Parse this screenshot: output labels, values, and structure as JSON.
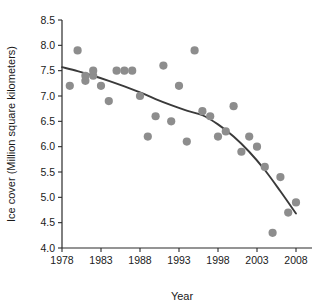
{
  "chart_data": {
    "type": "scatter",
    "title": "",
    "subtitle": "",
    "xlabel": "Year",
    "ylabel": "Ice cover (Million square kilometers)",
    "xlim": [
      1978,
      2008
    ],
    "ylim": [
      4.0,
      8.5
    ],
    "xticks": [
      1978,
      1983,
      1988,
      1993,
      1998,
      2003,
      2008
    ],
    "xtick_labels": [
      "1978",
      "1983",
      "1988",
      "1993",
      "1998",
      "2003",
      "2008"
    ],
    "yticks": [
      4.0,
      4.5,
      5.0,
      5.5,
      6.0,
      6.5,
      7.0,
      7.5,
      8.0,
      8.5
    ],
    "ytick_labels": [
      "4.0",
      "4.5",
      "5.0",
      "5.5",
      "6.0",
      "6.5",
      "7.0",
      "7.5",
      "8.0",
      "8.5"
    ],
    "grid": false,
    "legend": false,
    "legend_position": "none",
    "marker_color": "#8d8d8d",
    "trend_color": "#3a3a3a",
    "axis_color": "#2b2b2b",
    "background": "#ffffff",
    "x": [
      1979,
      1980,
      1981,
      1981,
      1982,
      1982,
      1983,
      1984,
      1985,
      1986,
      1987,
      1988,
      1989,
      1990,
      1991,
      1992,
      1993,
      1994,
      1995,
      1996,
      1997,
      1998,
      1999,
      2000,
      2001,
      2002,
      2003,
      2004,
      2005,
      2006,
      2007,
      2008
    ],
    "y": [
      7.2,
      7.9,
      7.3,
      7.4,
      7.4,
      7.5,
      7.2,
      6.9,
      7.5,
      7.5,
      7.5,
      7.0,
      6.2,
      6.6,
      7.6,
      6.5,
      7.2,
      6.1,
      7.9,
      6.7,
      6.6,
      6.2,
      6.3,
      6.8,
      5.9,
      6.2,
      6.0,
      5.6,
      4.3,
      5.4,
      4.7,
      4.9
    ],
    "series": [
      {
        "name": "Annual minimum ice cover",
        "type": "scatter",
        "points": [
          {
            "year": 1979,
            "value": 7.2
          },
          {
            "year": 1980,
            "value": 7.9
          },
          {
            "year": 1981,
            "value": 7.3
          },
          {
            "year": 1981,
            "value": 7.4
          },
          {
            "year": 1982,
            "value": 7.4
          },
          {
            "year": 1982,
            "value": 7.5
          },
          {
            "year": 1983,
            "value": 7.2
          },
          {
            "year": 1984,
            "value": 6.9
          },
          {
            "year": 1985,
            "value": 7.5
          },
          {
            "year": 1986,
            "value": 7.5
          },
          {
            "year": 1987,
            "value": 7.5
          },
          {
            "year": 1988,
            "value": 7.0
          },
          {
            "year": 1989,
            "value": 6.2
          },
          {
            "year": 1990,
            "value": 6.6
          },
          {
            "year": 1991,
            "value": 7.6
          },
          {
            "year": 1992,
            "value": 6.5
          },
          {
            "year": 1993,
            "value": 7.2
          },
          {
            "year": 1994,
            "value": 6.1
          },
          {
            "year": 1995,
            "value": 7.9
          },
          {
            "year": 1996,
            "value": 6.7
          },
          {
            "year": 1997,
            "value": 6.6
          },
          {
            "year": 1998,
            "value": 6.2
          },
          {
            "year": 1999,
            "value": 6.3
          },
          {
            "year": 2000,
            "value": 6.8
          },
          {
            "year": 2001,
            "value": 5.9
          },
          {
            "year": 2002,
            "value": 6.2
          },
          {
            "year": 2003,
            "value": 6.0
          },
          {
            "year": 2004,
            "value": 5.6
          },
          {
            "year": 2005,
            "value": 4.3
          },
          {
            "year": 2006,
            "value": 5.4
          },
          {
            "year": 2007,
            "value": 4.7
          },
          {
            "year": 2008,
            "value": 4.9
          }
        ]
      },
      {
        "name": "Fitted trend",
        "type": "line",
        "points": [
          {
            "year": 1978,
            "value": 7.57
          },
          {
            "year": 1980,
            "value": 7.49
          },
          {
            "year": 1982,
            "value": 7.4
          },
          {
            "year": 1984,
            "value": 7.3
          },
          {
            "year": 1986,
            "value": 7.19
          },
          {
            "year": 1988,
            "value": 7.07
          },
          {
            "year": 1990,
            "value": 6.94
          },
          {
            "year": 1992,
            "value": 6.82
          },
          {
            "year": 1994,
            "value": 6.71
          },
          {
            "year": 1996,
            "value": 6.62
          },
          {
            "year": 1998,
            "value": 6.44
          },
          {
            "year": 2000,
            "value": 6.2
          },
          {
            "year": 2002,
            "value": 5.9
          },
          {
            "year": 2004,
            "value": 5.54
          },
          {
            "year": 2006,
            "value": 5.12
          },
          {
            "year": 2008,
            "value": 4.68
          }
        ]
      }
    ]
  }
}
